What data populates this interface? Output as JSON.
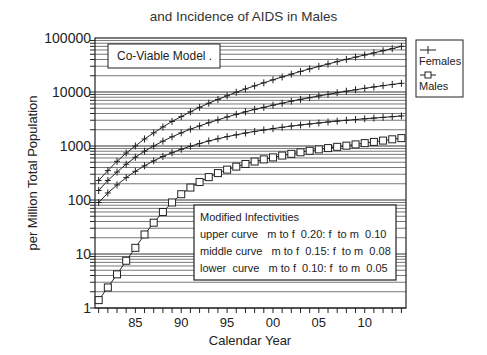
{
  "chart_data": {
    "type": "line",
    "title": "and Incidence of AIDS in Males",
    "xlabel": "Calendar Year",
    "ylabel": "per Million Total Population",
    "yscale": "log",
    "ylim": [
      1,
      100000
    ],
    "xlim": [
      1980.6,
      2014.5
    ],
    "grid": true,
    "y_tick_labels": [
      "100000",
      "10000",
      "1000",
      "100",
      "10",
      "1"
    ],
    "y_tick_values": [
      100000,
      10000,
      1000,
      100,
      10,
      1
    ],
    "x_tick_labels": [
      "85",
      "90",
      "95",
      "00",
      "05",
      "10"
    ],
    "x_tick_values": [
      1985,
      1990,
      1995,
      2000,
      2005,
      2010
    ],
    "legend": {
      "position": "right-outside",
      "entries": [
        {
          "label": "Females",
          "marker": "plus"
        },
        {
          "label": "Males",
          "marker": "square"
        }
      ]
    },
    "annotations": [
      {
        "text": "Co-Viable Model ."
      },
      {
        "lines": [
          "Modified Infectivities",
          "upper curve   m to f  0.20: f  to m  0.10",
          "middle curve   m to f  0.15: f  to m  0.08",
          "lower  curve   m to f  0.10: f  to m  0.05"
        ]
      }
    ],
    "x": [
      1981,
      1982,
      1983,
      1984,
      1985,
      1986,
      1987,
      1988,
      1989,
      1990,
      1991,
      1992,
      1993,
      1994,
      1995,
      1996,
      1997,
      1998,
      1999,
      2000,
      2001,
      2002,
      2003,
      2004,
      2005,
      2006,
      2007,
      2008,
      2009,
      2010,
      2011,
      2012,
      2013,
      2014
    ],
    "series": [
      {
        "name": "Females (upper curve)",
        "marker": "plus",
        "values": [
          230,
          350,
          520,
          740,
          1000,
          1350,
          1750,
          2250,
          2850,
          3500,
          4300,
          5200,
          6200,
          7300,
          8500,
          9900,
          11400,
          13000,
          14800,
          16800,
          19000,
          21400,
          24000,
          26800,
          29800,
          33000,
          36500,
          40200,
          44200,
          48500,
          53000,
          58000,
          63500,
          70000
        ]
      },
      {
        "name": "Females (middle curve)",
        "marker": "plus",
        "values": [
          150,
          230,
          330,
          460,
          620,
          800,
          1000,
          1230,
          1480,
          1750,
          2050,
          2350,
          2700,
          3050,
          3450,
          3850,
          4300,
          4750,
          5200,
          5700,
          6200,
          6750,
          7300,
          7850,
          8450,
          9050,
          9700,
          10350,
          11000,
          11700,
          12400,
          13100,
          13800,
          14500
        ]
      },
      {
        "name": "Females (lower curve)",
        "marker": "plus",
        "values": [
          90,
          135,
          190,
          260,
          340,
          430,
          530,
          640,
          750,
          870,
          990,
          1110,
          1240,
          1360,
          1490,
          1610,
          1740,
          1860,
          1980,
          2100,
          2220,
          2340,
          2450,
          2560,
          2670,
          2780,
          2890,
          2990,
          3090,
          3190,
          3290,
          3390,
          3490,
          3600
        ]
      },
      {
        "name": "Males",
        "marker": "square",
        "values": [
          1.4,
          2.4,
          4.2,
          7.5,
          13,
          23,
          38,
          60,
          90,
          128,
          170,
          215,
          265,
          315,
          365,
          415,
          465,
          515,
          565,
          615,
          665,
          715,
          765,
          815,
          865,
          915,
          965,
          1015,
          1070,
          1130,
          1190,
          1260,
          1330,
          1400
        ]
      }
    ]
  }
}
